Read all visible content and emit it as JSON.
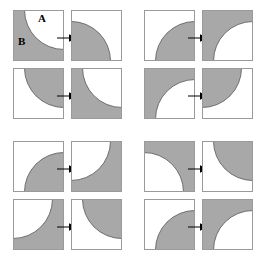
{
  "figure": {
    "width": 263,
    "height": 261,
    "background_color": "#ffffff",
    "gray_color": "#a8a8a8",
    "white_color": "#ffffff",
    "outline_color": "#9a9a9a",
    "curve_outline_color": "#6e6e6e",
    "arrow_color": "#000000",
    "labels": [
      {
        "text": "A",
        "name": "region-label-a"
      },
      {
        "text": "B",
        "name": "region-label-b"
      }
    ]
  },
  "groups": [
    {
      "name": "group-top-left",
      "position": {
        "x": 0,
        "y": 0
      },
      "pairs": [
        {
          "name": "pair-1",
          "source": {
            "background": "gray",
            "disc_fill": "white",
            "disc_corner": "top-right"
          },
          "result": {
            "background": "white",
            "disc_fill": "gray",
            "disc_corner": "bottom-left"
          },
          "arrow": "right-arrow"
        },
        {
          "name": "pair-2",
          "source": {
            "background": "white",
            "disc_fill": "gray",
            "disc_corner": "top-right"
          },
          "result": {
            "background": "gray",
            "disc_fill": "white",
            "disc_corner": "top-right"
          },
          "arrow": "right-arrow"
        }
      ]
    },
    {
      "name": "group-top-right",
      "position": {
        "x": 131,
        "y": 0
      },
      "pairs": [
        {
          "name": "pair-3",
          "source": {
            "background": "white",
            "disc_fill": "gray",
            "disc_corner": "bottom-right"
          },
          "result": {
            "background": "gray",
            "disc_fill": "white",
            "disc_corner": "bottom-right"
          },
          "arrow": "right-arrow"
        },
        {
          "name": "pair-4",
          "source": {
            "background": "gray",
            "disc_fill": "white",
            "disc_corner": "bottom-right"
          },
          "result": {
            "background": "white",
            "disc_fill": "gray",
            "disc_corner": "top-left"
          },
          "arrow": "right-arrow"
        }
      ]
    },
    {
      "name": "group-bottom-left",
      "position": {
        "x": 0,
        "y": 131
      },
      "pairs": [
        {
          "name": "pair-5",
          "source": {
            "background": "white",
            "disc_fill": "gray",
            "disc_corner": "bottom-right"
          },
          "result": {
            "background": "gray",
            "disc_fill": "white",
            "disc_corner": "top-left"
          },
          "arrow": "right-arrow"
        },
        {
          "name": "pair-6",
          "source": {
            "background": "gray",
            "disc_fill": "white",
            "disc_corner": "top-left"
          },
          "result": {
            "background": "white",
            "disc_fill": "gray",
            "disc_corner": "top-right"
          },
          "arrow": "right-arrow"
        }
      ]
    },
    {
      "name": "group-bottom-right",
      "position": {
        "x": 131,
        "y": 131
      },
      "pairs": [
        {
          "name": "pair-7",
          "source": {
            "background": "gray",
            "disc_fill": "white",
            "disc_corner": "bottom-left"
          },
          "result": {
            "background": "white",
            "disc_fill": "gray",
            "disc_corner": "top-right"
          },
          "arrow": "right-arrow"
        },
        {
          "name": "pair-8",
          "source": {
            "background": "white",
            "disc_fill": "gray",
            "disc_corner": "bottom-right"
          },
          "result": {
            "background": "gray",
            "disc_fill": "white",
            "disc_corner": "bottom-right"
          },
          "arrow": "right-arrow"
        }
      ]
    }
  ]
}
